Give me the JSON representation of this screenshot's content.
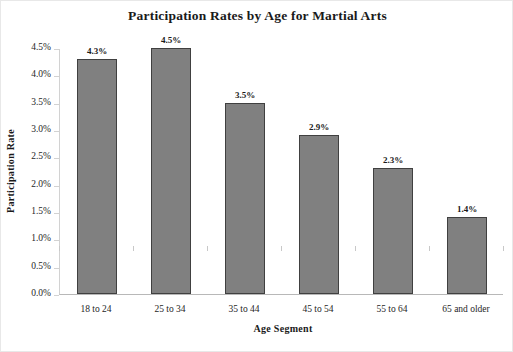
{
  "chart_data": {
    "type": "bar",
    "title": "Participation Rates by Age for Martial Arts",
    "xlabel": "Age Segment",
    "ylabel": "Participation Rate",
    "categories": [
      "18 to 24",
      "25 to 34",
      "35 to 44",
      "45 to 54",
      "55 to 64",
      "65 and older"
    ],
    "values": [
      4.3,
      4.5,
      3.5,
      2.9,
      2.3,
      1.4
    ],
    "data_labels": [
      "4.3%",
      "4.5%",
      "3.5%",
      "2.9%",
      "2.3%",
      "1.4%"
    ],
    "ylim": [
      0.0,
      4.5
    ],
    "ytick_values": [
      0.0,
      0.5,
      1.0,
      1.5,
      2.0,
      2.5,
      3.0,
      3.5,
      4.0,
      4.5
    ],
    "ytick_labels": [
      "0.0%",
      "0.5%",
      "1.0%",
      "1.5%",
      "2.0%",
      "2.5%",
      "3.0%",
      "3.5%",
      "4.0%",
      "4.5%"
    ],
    "grid": false,
    "legend": false,
    "bar_color": "#808080",
    "bar_border_color": "#404040",
    "background_color": "#ffffff",
    "text_color": "#1a1a1a"
  }
}
